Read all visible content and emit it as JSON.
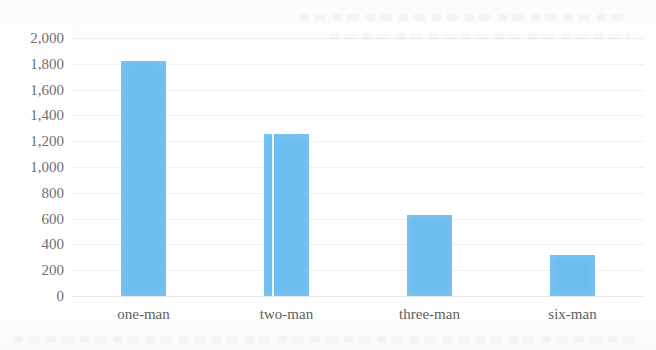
{
  "chart_data": {
    "type": "bar",
    "title": "",
    "subtitle": "",
    "xlabel": "",
    "ylabel": "",
    "categories": [
      "one-man",
      "two-man",
      "three-man",
      "six-man"
    ],
    "values": [
      1825,
      1255,
      630,
      315
    ],
    "series": [
      {
        "name": "count",
        "values": [
          1825,
          1255,
          630,
          315
        ],
        "color": "#6dbef0"
      }
    ],
    "ylim": [
      0,
      2000
    ],
    "ytick_values": [
      0,
      200,
      400,
      600,
      800,
      1000,
      1200,
      1400,
      1600,
      1800,
      2000
    ],
    "ytick_labels": [
      "0",
      "200",
      "400",
      "600",
      "800",
      "1,000",
      "1,200",
      "1,400",
      "1,600",
      "1,800",
      "2,000"
    ],
    "grid": true,
    "grid_axis": "y",
    "legend": false,
    "legend_position": "none",
    "bar_color": "#6dbef0",
    "background_color": "#fdfdfc",
    "axis_label_color": "#6f6f6f",
    "annotations": [
      {
        "kind": "scan-artifact",
        "description": "thin white vertical scan line through the two-man bar"
      }
    ]
  }
}
